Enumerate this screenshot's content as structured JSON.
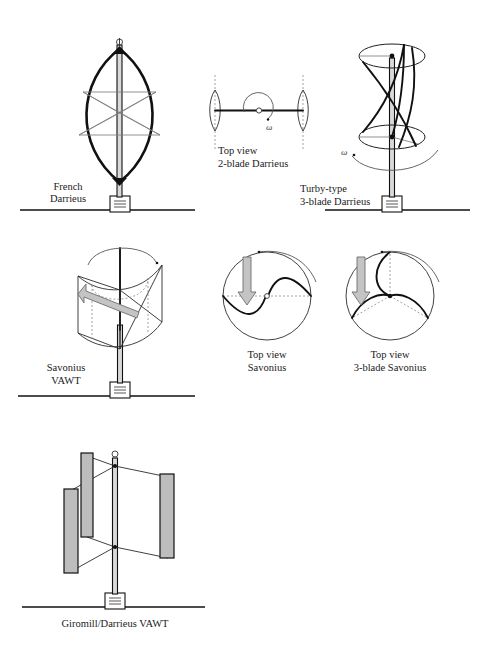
{
  "figure": {
    "background_color": "#ffffff",
    "line_color": "#111111",
    "blade_fill_color": "#bdbdbd",
    "arrow_fill_color": "#c4c4c4",
    "mast_fill_color": "#d9d9d9"
  },
  "panels": [
    {
      "id": "french-darrieus",
      "label_line1": "French",
      "label_line2": "Darrieus",
      "view": "elevation",
      "blade_count": 2,
      "has_ground": true,
      "has_base_box": true,
      "has_finial": true
    },
    {
      "id": "top-view-2-blade-darrieus",
      "label_line1": "Top  view",
      "label_line2": "2-blade Darrieus",
      "view": "plan",
      "blade_count": 2,
      "rotation_symbol": "ω",
      "has_ground": false
    },
    {
      "id": "turby-type-3-blade-darrieus",
      "label_line1": "Turby-type",
      "label_line2": "3-blade Darrieus",
      "view": "elevation",
      "blade_count": 3,
      "rotation_symbol": "ω",
      "has_ground": true,
      "has_base_box": true
    },
    {
      "id": "savonius-vawt",
      "label_line1": "Savonius",
      "label_line2": "VAWT",
      "view": "isometric",
      "blade_count": 2,
      "has_wind_arrow": true,
      "has_ground": true,
      "has_base_box": true
    },
    {
      "id": "top-view-savonius",
      "label_line1": "Top view",
      "label_line2": "Savonius",
      "view": "plan",
      "blade_count": 2,
      "has_wind_arrow": true,
      "has_ground": false
    },
    {
      "id": "top-view-3-blade-savonius",
      "label_line1": "Top view",
      "label_line2": "3-blade Savonius",
      "view": "plan",
      "blade_count": 3,
      "has_wind_arrow": true,
      "has_ground": false
    },
    {
      "id": "giromill-darrieus-vawt",
      "label_single": "Giromill/Darrieus VAWT",
      "view": "isometric",
      "blade_count": 3,
      "has_ground": true,
      "has_base_box": true,
      "has_finial": true
    }
  ]
}
